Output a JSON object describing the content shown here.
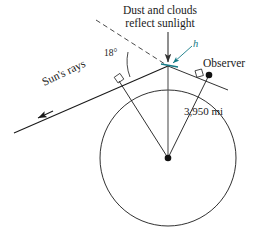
{
  "figure": {
    "title_line1": "Dust and clouds",
    "title_line2": "reflect sunlight",
    "angle_label": "18°",
    "height_label": "h",
    "observer_label": "Observer",
    "radius_label": "3,950 mi",
    "sun_rays_label": "Sun's rays",
    "colors": {
      "line": "#1a1a1a",
      "height_accent": "#147a86",
      "background": "#ffffff"
    },
    "geometry": {
      "circle_center_x": 168,
      "circle_center_y": 158,
      "circle_radius": 68,
      "apex_x": 168,
      "apex_y": 66,
      "left_tangent_x": 119,
      "left_tangent_y": 81,
      "observer_x": 209,
      "observer_y": 75,
      "sun_ray_angle_deg": 18
    }
  }
}
